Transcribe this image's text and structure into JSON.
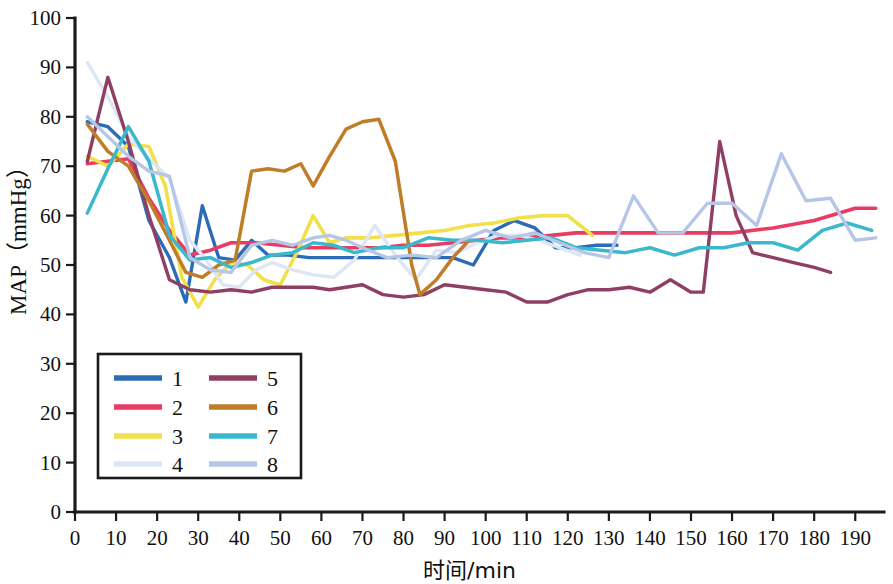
{
  "chart_data": {
    "type": "line",
    "title": "",
    "xlabel": "时间/min",
    "ylabel": "MAP（mmHg）",
    "xlim": [
      0,
      197
    ],
    "ylim": [
      0,
      100
    ],
    "xticks": [
      0,
      10,
      20,
      30,
      40,
      50,
      60,
      70,
      80,
      90,
      100,
      110,
      120,
      130,
      140,
      150,
      160,
      170,
      180,
      190
    ],
    "yticks": [
      0,
      10,
      20,
      30,
      40,
      50,
      60,
      70,
      80,
      90,
      100
    ],
    "grid": false,
    "legend_position": "lower-left-inside",
    "series": [
      {
        "name": "1",
        "color": "#2b6cb8",
        "width": 3.4,
        "x": [
          3,
          8,
          13,
          18,
          23,
          27,
          31,
          35,
          39,
          43,
          47,
          52,
          57,
          62,
          67,
          72,
          77,
          82,
          87,
          92,
          97,
          102,
          107,
          112,
          117,
          122,
          127,
          132
        ],
        "y": [
          79,
          78,
          74,
          59,
          51.5,
          42.5,
          62,
          51.5,
          51,
          55,
          52,
          52,
          51.5,
          51.5,
          51.5,
          51.5,
          51.5,
          51.5,
          51.5,
          51.5,
          50,
          57,
          59,
          57.5,
          53.5,
          53.5,
          54,
          54
        ]
      },
      {
        "name": "2",
        "color": "#ea3b62",
        "width": 3.6,
        "x": [
          3,
          8,
          13,
          18,
          23,
          28,
          33,
          38,
          44,
          50,
          56,
          62,
          68,
          74,
          80,
          86,
          92,
          98,
          104,
          110,
          116,
          122,
          130,
          140,
          150,
          160,
          170,
          180,
          190,
          195
        ],
        "y": [
          70.5,
          71,
          71.5,
          63.5,
          57,
          52,
          53,
          54.5,
          54.5,
          54,
          53.5,
          53.5,
          53.5,
          53.5,
          54,
          54,
          54.5,
          55,
          55.5,
          55.5,
          56,
          56.5,
          56.5,
          56.5,
          56.5,
          56.5,
          57.5,
          59,
          61.5,
          61.5
        ]
      },
      {
        "name": "3",
        "color": "#f2e04a",
        "width": 3.6,
        "x": [
          3,
          8,
          13,
          18,
          22,
          26,
          30,
          34,
          38,
          42,
          46,
          50,
          54,
          58,
          62,
          66,
          72,
          78,
          84,
          90,
          96,
          102,
          108,
          114,
          120,
          126
        ],
        "y": [
          72,
          70,
          74.5,
          74,
          66,
          47.5,
          41.5,
          47,
          50.5,
          50,
          47,
          46,
          52.5,
          60,
          54.5,
          55.5,
          55.5,
          56,
          56.5,
          57,
          58,
          58.5,
          59.5,
          60,
          60,
          56
        ]
      },
      {
        "name": "4",
        "color": "#dde6f5",
        "width": 3.4,
        "x": [
          3,
          8,
          13,
          18,
          23,
          28,
          32,
          36,
          40,
          44,
          48,
          53,
          58,
          63,
          68,
          73,
          78,
          83,
          88,
          93,
          98,
          103,
          108,
          113,
          118,
          123
        ],
        "y": [
          91,
          84,
          76,
          71.5,
          67.5,
          55,
          51,
          46,
          45.5,
          49,
          50.5,
          49,
          48,
          47.5,
          51,
          58,
          52,
          47,
          53,
          52.5,
          54.5,
          56,
          56,
          55,
          53.5,
          52
        ]
      },
      {
        "name": "5",
        "color": "#8e3f63",
        "width": 3.4,
        "x": [
          3,
          8,
          13,
          18,
          23,
          28,
          33,
          38,
          43,
          48,
          53,
          58,
          62,
          66,
          70,
          75,
          80,
          85,
          90,
          95,
          100,
          105,
          110,
          115,
          120,
          125,
          130,
          135,
          140,
          145,
          150,
          153,
          157,
          161,
          165,
          170,
          175,
          180,
          184
        ],
        "y": [
          71,
          88,
          75,
          60,
          47,
          45,
          44.5,
          45,
          44.5,
          45.5,
          45.5,
          45.5,
          45,
          45.5,
          46,
          44,
          43.5,
          44,
          46,
          45.5,
          45,
          44.5,
          42.5,
          42.5,
          44,
          45,
          45,
          45.5,
          44.5,
          47,
          44.5,
          44.5,
          75,
          60,
          52.5,
          51.5,
          50.5,
          49.5,
          48.5
        ]
      },
      {
        "name": "6",
        "color": "#c07d28",
        "width": 3.5,
        "x": [
          3,
          8,
          13,
          18,
          23,
          27,
          31,
          35,
          39,
          43,
          47,
          51,
          55,
          58,
          62,
          66,
          70,
          74,
          78,
          82,
          84,
          88,
          92,
          96
        ],
        "y": [
          78.5,
          73,
          70,
          63,
          55,
          48.5,
          47.5,
          50,
          51,
          69,
          69.5,
          69,
          70.5,
          66,
          72,
          77.5,
          79,
          79.5,
          71,
          50,
          44,
          47,
          51.5,
          55
        ]
      },
      {
        "name": "7",
        "color": "#3ab8cc",
        "width": 3.5,
        "x": [
          3,
          8,
          13,
          18,
          23,
          28,
          33,
          38,
          43,
          48,
          53,
          58,
          63,
          68,
          74,
          80,
          86,
          92,
          98,
          104,
          110,
          116,
          122,
          128,
          134,
          140,
          146,
          152,
          158,
          164,
          170,
          176,
          182,
          188,
          194
        ],
        "y": [
          60.5,
          69.5,
          78,
          71,
          56,
          51,
          51.5,
          49.5,
          50.5,
          52,
          52.5,
          54.5,
          54,
          52.5,
          53.5,
          53.5,
          55.5,
          55,
          55,
          54.5,
          55,
          55.5,
          53.5,
          53,
          52.5,
          53.5,
          52,
          53.5,
          53.5,
          54.5,
          54.5,
          53,
          57,
          58.5,
          57
        ]
      },
      {
        "name": "8",
        "color": "#b6c6e6",
        "width": 3.4,
        "x": [
          3,
          8,
          13,
          18,
          23,
          28,
          33,
          38,
          43,
          48,
          53,
          58,
          62,
          66,
          70,
          76,
          82,
          88,
          94,
          100,
          106,
          112,
          118,
          124,
          130,
          136,
          142,
          148,
          154,
          160,
          166,
          172,
          178,
          184,
          190,
          195
        ],
        "y": [
          80,
          76,
          72,
          69,
          68,
          51.5,
          49,
          48.5,
          54,
          55,
          54,
          55.5,
          56,
          55,
          53.5,
          51.5,
          52,
          51.5,
          55,
          57,
          55.5,
          56.5,
          54.5,
          52.5,
          51.5,
          64,
          56.5,
          56.5,
          62.5,
          62.5,
          58,
          72.5,
          63,
          63.5,
          55,
          55.5
        ]
      }
    ],
    "legend": {
      "entries": [
        {
          "label": "1",
          "color": "#2b6cb8"
        },
        {
          "label": "2",
          "color": "#ea3b62"
        },
        {
          "label": "3",
          "color": "#f2e04a"
        },
        {
          "label": "4",
          "color": "#dde6f5"
        },
        {
          "label": "5",
          "color": "#8e3f63"
        },
        {
          "label": "6",
          "color": "#c07d28"
        },
        {
          "label": "7",
          "color": "#3ab8cc"
        },
        {
          "label": "8",
          "color": "#b6c6e6"
        }
      ]
    }
  }
}
